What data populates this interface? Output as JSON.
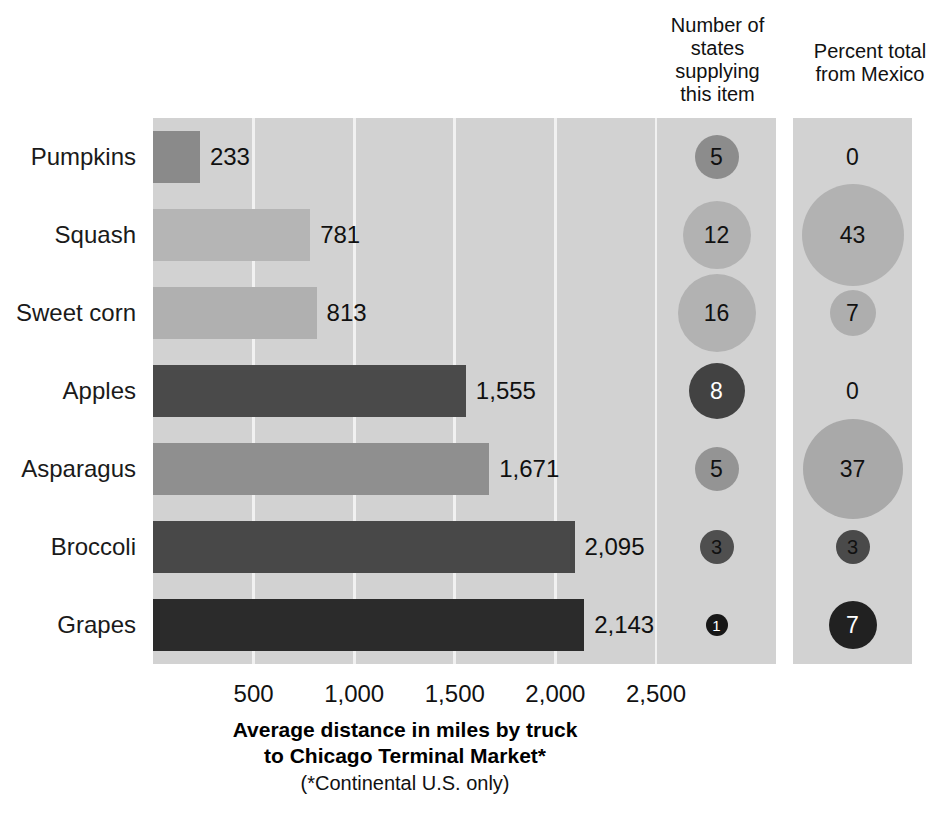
{
  "headers": {
    "states": "Number of\nstates\nsupplying\nthis item",
    "mexico": "Percent total\nfrom Mexico"
  },
  "axis": {
    "title_line1": "Average distance in miles by truck",
    "title_line2": "to Chicago Terminal Market*",
    "note": "(*Continental U.S. only)",
    "ticks": [
      "500",
      "1,000",
      "1,500",
      "2,000",
      "2,500"
    ]
  },
  "chart_data": {
    "type": "bar",
    "title": "Average distance in miles by truck to Chicago Terminal Market*",
    "subtitle": "(*Continental U.S. only)",
    "xlabel": "Average distance in miles by truck to Chicago Terminal Market*",
    "ylabel": "",
    "xlim": [
      0,
      2500
    ],
    "xticks": [
      500,
      1000,
      1500,
      2000,
      2500
    ],
    "grid": true,
    "orientation": "horizontal",
    "legend": "none",
    "categories": [
      "Pumpkins",
      "Squash",
      "Sweet corn",
      "Apples",
      "Asparagus",
      "Broccoli",
      "Grapes"
    ],
    "series": [
      {
        "name": "Average distance in miles by truck",
        "values": [
          233,
          781,
          813,
          1555,
          1671,
          2095,
          2143
        ],
        "labels": [
          "233",
          "781",
          "813",
          "1,555",
          "1,671",
          "2,095",
          "2,143"
        ],
        "colors": [
          "#8a8a8a",
          "#b5b5b5",
          "#b0b0b0",
          "#4a4a4a",
          "#8f8f8f",
          "#484848",
          "#2b2b2b"
        ]
      },
      {
        "name": "Number of states supplying this item",
        "values": [
          5,
          12,
          16,
          8,
          5,
          3,
          1
        ],
        "labels": [
          "5",
          "12",
          "16",
          "8",
          "5",
          "3",
          "1"
        ],
        "colors": [
          "#8c8c8c",
          "#b2b2b2",
          "#b2b2b2",
          "#424242",
          "#949494",
          "#4f4f4f",
          "#171717"
        ],
        "text_colors": [
          "#111111",
          "#111111",
          "#111111",
          "#ffffff",
          "#111111",
          "#111111",
          "#ffffff"
        ],
        "diameters": [
          44,
          68,
          78,
          56,
          44,
          34,
          22
        ]
      },
      {
        "name": "Percent total from Mexico",
        "values": [
          0,
          43,
          7,
          0,
          37,
          3,
          7
        ],
        "labels": [
          "0",
          "43",
          "7",
          "0",
          "37",
          "3",
          "7"
        ],
        "colors": [
          "none",
          "#b2b2b2",
          "#aeaeae",
          "none",
          "#a9a9a9",
          "#4a4a4a",
          "#212121"
        ],
        "text_colors": [
          "#111111",
          "#111111",
          "#111111",
          "#111111",
          "#111111",
          "#111111",
          "#ffffff"
        ],
        "diameters": [
          0,
          102,
          46,
          0,
          100,
          34,
          48
        ]
      }
    ]
  },
  "rows": [
    {
      "category": "Pumpkins",
      "distance": "233",
      "states": "5",
      "mexico": "0"
    },
    {
      "category": "Squash",
      "distance": "781",
      "states": "12",
      "mexico": "43"
    },
    {
      "category": "Sweet corn",
      "distance": "813",
      "states": "16",
      "mexico": "7"
    },
    {
      "category": "Apples",
      "distance": "1,555",
      "states": "8",
      "mexico": "0"
    },
    {
      "category": "Asparagus",
      "distance": "1,671",
      "states": "5",
      "mexico": "37"
    },
    {
      "category": "Broccoli",
      "distance": "2,095",
      "states": "3",
      "mexico": "3"
    },
    {
      "category": "Grapes",
      "distance": "2,143",
      "states": "1",
      "mexico": "7"
    }
  ]
}
